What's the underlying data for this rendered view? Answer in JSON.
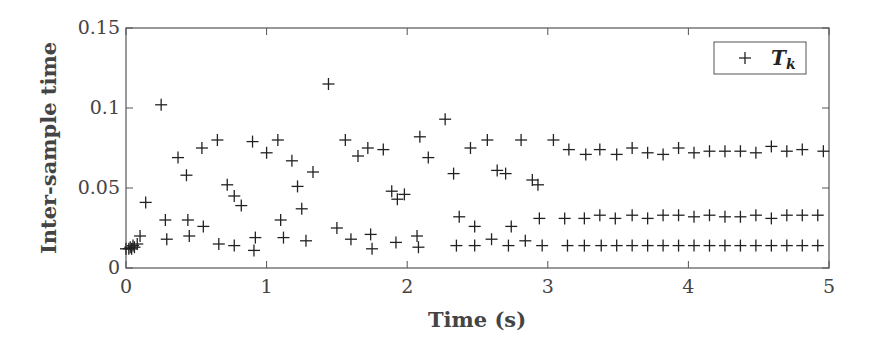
{
  "chart_data": {
    "type": "scatter",
    "title": "",
    "xlabel": "Time (s)",
    "ylabel": "Inter-sample time",
    "xlim": [
      0,
      5
    ],
    "ylim": [
      0,
      0.15
    ],
    "xticks": [
      0,
      1,
      2,
      3,
      4,
      5
    ],
    "xtick_labels": [
      "0",
      "1",
      "2",
      "3",
      "4",
      "5"
    ],
    "yticks": [
      0,
      0.05,
      0.1,
      0.15
    ],
    "ytick_labels": [
      "0",
      "0.05",
      "0.1",
      "0.15"
    ],
    "grid": false,
    "legend_position": "upper right",
    "marker": "+",
    "color": "#222222",
    "series": [
      {
        "name": "T_k",
        "legend_label": "T",
        "legend_subscript": "k",
        "points": [
          [
            0.0,
            0.012
          ],
          [
            0.02,
            0.012
          ],
          [
            0.03,
            0.013
          ],
          [
            0.04,
            0.012
          ],
          [
            0.05,
            0.014
          ],
          [
            0.06,
            0.013
          ],
          [
            0.08,
            0.015
          ],
          [
            0.1,
            0.02
          ],
          [
            0.14,
            0.041
          ],
          [
            0.25,
            0.102
          ],
          [
            0.28,
            0.03
          ],
          [
            0.29,
            0.018
          ],
          [
            0.37,
            0.069
          ],
          [
            0.43,
            0.058
          ],
          [
            0.44,
            0.03
          ],
          [
            0.45,
            0.02
          ],
          [
            0.55,
            0.026
          ],
          [
            0.54,
            0.075
          ],
          [
            0.65,
            0.08
          ],
          [
            0.66,
            0.015
          ],
          [
            0.72,
            0.052
          ],
          [
            0.77,
            0.045
          ],
          [
            0.77,
            0.014
          ],
          [
            0.82,
            0.039
          ],
          [
            0.9,
            0.079
          ],
          [
            0.91,
            0.011
          ],
          [
            0.92,
            0.019
          ],
          [
            1.0,
            0.072
          ],
          [
            1.08,
            0.08
          ],
          [
            1.1,
            0.03
          ],
          [
            1.12,
            0.019
          ],
          [
            1.18,
            0.067
          ],
          [
            1.22,
            0.051
          ],
          [
            1.25,
            0.037
          ],
          [
            1.28,
            0.017
          ],
          [
            1.33,
            0.06
          ],
          [
            1.44,
            0.115
          ],
          [
            1.5,
            0.025
          ],
          [
            1.56,
            0.08
          ],
          [
            1.6,
            0.018
          ],
          [
            1.65,
            0.07
          ],
          [
            1.72,
            0.075
          ],
          [
            1.74,
            0.021
          ],
          [
            1.75,
            0.012
          ],
          [
            1.83,
            0.074
          ],
          [
            1.89,
            0.048
          ],
          [
            1.93,
            0.043
          ],
          [
            1.98,
            0.046
          ],
          [
            1.92,
            0.016
          ],
          [
            2.07,
            0.02
          ],
          [
            2.08,
            0.013
          ],
          [
            2.09,
            0.082
          ],
          [
            2.15,
            0.069
          ],
          [
            2.27,
            0.093
          ],
          [
            2.33,
            0.059
          ],
          [
            2.35,
            0.014
          ],
          [
            2.37,
            0.032
          ],
          [
            2.45,
            0.075
          ],
          [
            2.48,
            0.026
          ],
          [
            2.48,
            0.014
          ],
          [
            2.57,
            0.08
          ],
          [
            2.6,
            0.018
          ],
          [
            2.64,
            0.061
          ],
          [
            2.7,
            0.059
          ],
          [
            2.72,
            0.014
          ],
          [
            2.74,
            0.026
          ],
          [
            2.81,
            0.08
          ],
          [
            2.84,
            0.017
          ],
          [
            2.89,
            0.055
          ],
          [
            2.93,
            0.052
          ],
          [
            2.94,
            0.031
          ],
          [
            2.96,
            0.014
          ],
          [
            3.04,
            0.08
          ],
          [
            3.12,
            0.031
          ],
          [
            3.14,
            0.014
          ],
          [
            3.15,
            0.074
          ],
          [
            3.26,
            0.031
          ],
          [
            3.26,
            0.014
          ],
          [
            3.27,
            0.071
          ],
          [
            3.37,
            0.074
          ],
          [
            3.37,
            0.033
          ],
          [
            3.38,
            0.014
          ],
          [
            3.48,
            0.031
          ],
          [
            3.49,
            0.014
          ],
          [
            3.49,
            0.071
          ],
          [
            3.6,
            0.033
          ],
          [
            3.6,
            0.014
          ],
          [
            3.6,
            0.075
          ],
          [
            3.71,
            0.031
          ],
          [
            3.71,
            0.014
          ],
          [
            3.71,
            0.072
          ],
          [
            3.82,
            0.033
          ],
          [
            3.82,
            0.014
          ],
          [
            3.82,
            0.071
          ],
          [
            3.93,
            0.033
          ],
          [
            3.93,
            0.014
          ],
          [
            3.93,
            0.075
          ],
          [
            4.04,
            0.032
          ],
          [
            4.04,
            0.014
          ],
          [
            4.04,
            0.072
          ],
          [
            4.15,
            0.033
          ],
          [
            4.15,
            0.014
          ],
          [
            4.15,
            0.073
          ],
          [
            4.26,
            0.032
          ],
          [
            4.26,
            0.014
          ],
          [
            4.26,
            0.073
          ],
          [
            4.37,
            0.032
          ],
          [
            4.37,
            0.014
          ],
          [
            4.37,
            0.073
          ],
          [
            4.48,
            0.033
          ],
          [
            4.48,
            0.014
          ],
          [
            4.48,
            0.072
          ],
          [
            4.59,
            0.031
          ],
          [
            4.59,
            0.014
          ],
          [
            4.59,
            0.076
          ],
          [
            4.7,
            0.033
          ],
          [
            4.7,
            0.014
          ],
          [
            4.7,
            0.073
          ],
          [
            4.81,
            0.033
          ],
          [
            4.81,
            0.014
          ],
          [
            4.81,
            0.074
          ],
          [
            4.92,
            0.033
          ],
          [
            4.92,
            0.014
          ],
          [
            4.96,
            0.073
          ]
        ]
      }
    ]
  }
}
